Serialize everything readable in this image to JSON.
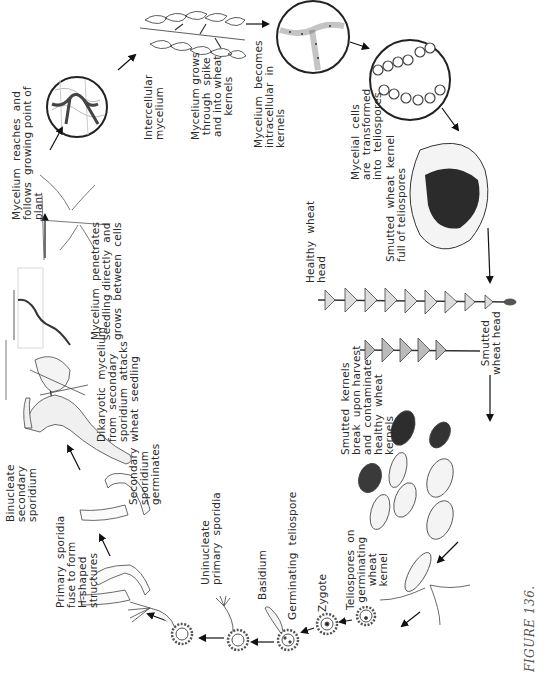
{
  "figure": {
    "caption": "FIGURE 136.",
    "orientation": "rotated -90deg (landscape page)"
  },
  "stages": [
    {
      "id": "intercellular-mycelium",
      "label": "Intercellular\nmycelium"
    },
    {
      "id": "mycelium-grows-spike",
      "label": "Mycelium grows\nthrough  spike\nand into wheat\nkernels"
    },
    {
      "id": "mycelium-intracellular",
      "label": "Mycelium  becomes\nintracellular  in\nkernels"
    },
    {
      "id": "mycelial-cells-transformed",
      "label": "Mycelial  cells\nare  transformed\ninto  teliospores"
    },
    {
      "id": "smutted-kernel",
      "label": "Smutted  wheat  kernel\nfull of teliospores"
    },
    {
      "id": "healthy-head",
      "label": "Healthy  wheat\nhead"
    },
    {
      "id": "smutted-head",
      "label": "Smutted\nwheat head"
    },
    {
      "id": "kernels-break",
      "label": "Smutted  kernels\nbreak  upon harvest\nand  contaminate\nhealthy  wheat\nkernels"
    },
    {
      "id": "teliospores-on-kernel",
      "label": "Teliospores  on\ngerminating\nwheat\nkernel"
    },
    {
      "id": "zygote",
      "label": "Zygote"
    },
    {
      "id": "germinating-teliospore",
      "label": "Germinating  teliospore"
    },
    {
      "id": "basidium",
      "label": "Basidium"
    },
    {
      "id": "uninucleate-primary",
      "label": "Uninucleate\nprimary  sporidia"
    },
    {
      "id": "primary-sporidia-fuse",
      "label": "Primary  sporidia\nfuse to form\nH-shaped\nstructures"
    },
    {
      "id": "binucleate-secondary",
      "label": "Binucleate\nsecondary\nsporidium"
    },
    {
      "id": "secondary-germinates",
      "label": "Secondary\nsporidium\ngerminates"
    },
    {
      "id": "dikaryotic-mycelium",
      "label": "Dikaryotic  mycelium\nfrom  secondary\nsporidium  attacks\nwheat  seedling"
    },
    {
      "id": "mycelium-penetrates",
      "label": "Mycelium  penetrates\nseedling directly  and\ngrows  between  cells"
    },
    {
      "id": "mycelium-reaches",
      "label": "Mycelium  reaches  and\nfollows  growing point of\nplant"
    }
  ],
  "colors": {
    "ink": "#2a2a2a",
    "line": "#333333",
    "fill_light": "#f2f2f2",
    "fill_dark": "#2b2b2b",
    "background": "#ffffff"
  }
}
